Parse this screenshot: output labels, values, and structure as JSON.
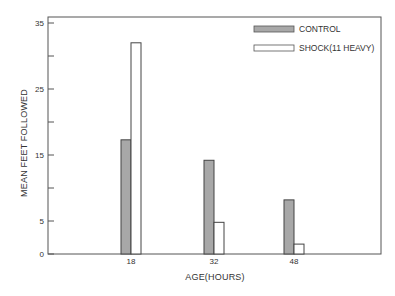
{
  "chart_data": {
    "type": "bar",
    "title": "",
    "xlabel": "AGE(HOURS)",
    "ylabel": "MEAN FEET FOLLOWED",
    "categories": [
      "18",
      "32",
      "48"
    ],
    "series": [
      {
        "name": "CONTROL",
        "values": [
          17.3,
          14.2,
          8.2
        ],
        "color": "#a8a8a8",
        "pattern": "stippled gray"
      },
      {
        "name": "SHOCK(11 HEAVY)",
        "values": [
          32,
          4.8,
          1.5
        ],
        "color": "#ffffff",
        "pattern": "open"
      }
    ],
    "ylim": [
      0,
      35
    ],
    "yticks": [
      0,
      5,
      10,
      15,
      20,
      25,
      30,
      35
    ],
    "ytick_labels": [
      "0",
      "5",
      "",
      "15",
      "",
      "25",
      "",
      "35"
    ],
    "grid": false,
    "legend_position": "upper right"
  },
  "legend": {
    "items": [
      {
        "label": "CONTROL"
      },
      {
        "label": "SHOCK(11 HEAVY)"
      }
    ]
  },
  "axes": {
    "xlabel": "AGE(HOURS)",
    "ylabel": "MEAN FEET FOLLOWED"
  }
}
